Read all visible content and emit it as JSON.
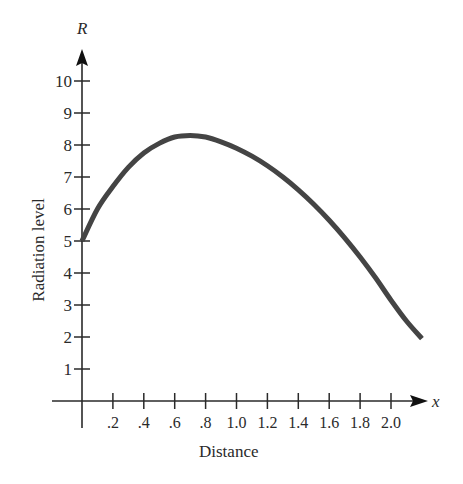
{
  "chart_data": {
    "type": "line",
    "title": "",
    "xlabel": "Distance",
    "ylabel": "Radiation level",
    "x_axis_symbol": "x",
    "y_axis_symbol": "R",
    "x_ticks": [
      ".2",
      ".4",
      ".6",
      ".8",
      "1.0",
      "1.2",
      "1.4",
      "1.6",
      "1.8",
      "2.0"
    ],
    "y_ticks": [
      "1",
      "2",
      "3",
      "4",
      "5",
      "6",
      "7",
      "8",
      "9",
      "10"
    ],
    "xlim": [
      0,
      2.2
    ],
    "ylim": [
      0,
      10.5
    ],
    "grid": false,
    "legend": null,
    "series": [
      {
        "name": "R(x)",
        "x": [
          0,
          0.1,
          0.2,
          0.3,
          0.4,
          0.5,
          0.6,
          0.7,
          0.8,
          0.9,
          1.0,
          1.1,
          1.2,
          1.3,
          1.4,
          1.5,
          1.6,
          1.7,
          1.8,
          1.9,
          2.0,
          2.1,
          2.2
        ],
        "values": [
          5.0,
          6.0,
          6.7,
          7.3,
          7.75,
          8.05,
          8.25,
          8.3,
          8.25,
          8.1,
          7.9,
          7.65,
          7.35,
          7.0,
          6.6,
          6.15,
          5.65,
          5.1,
          4.5,
          3.85,
          3.15,
          2.5,
          1.95
        ]
      }
    ]
  }
}
